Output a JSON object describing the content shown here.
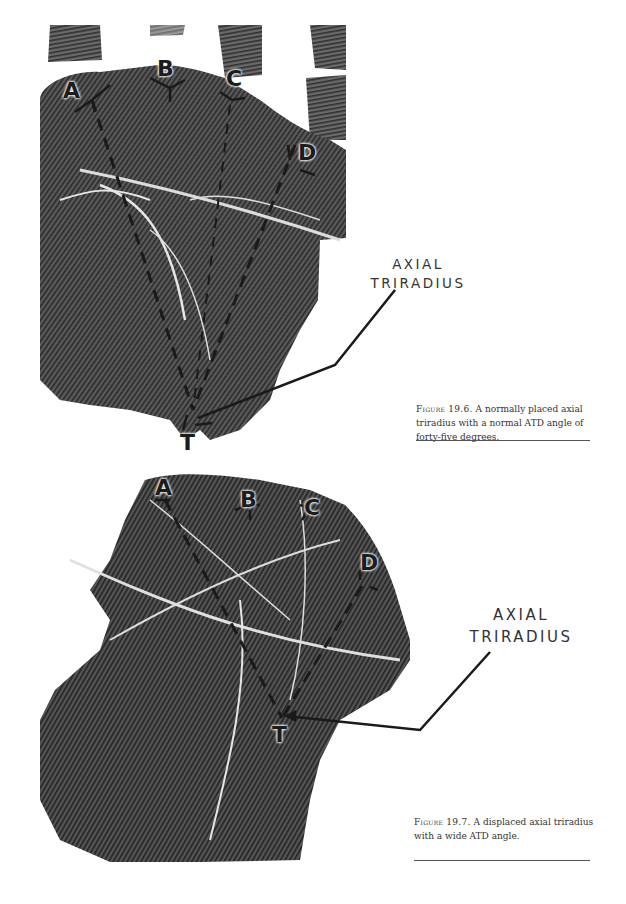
{
  "figures": [
    {
      "id": "19.6",
      "labels": {
        "a": "A",
        "b": "B",
        "c": "C",
        "d": "D",
        "t": "T"
      },
      "axial_label": {
        "line1": "AXIAL",
        "line2": "TRIRADIUS"
      },
      "caption": {
        "label": "Figure 19.6.",
        "text": " A normally placed axial triradius with a normal ATD angle of forty-five degrees."
      }
    },
    {
      "id": "19.7",
      "labels": {
        "a": "A",
        "b": "B",
        "c": "C",
        "d": "D",
        "t": "T"
      },
      "axial_label": {
        "line1": "AXIAL",
        "line2": "TRIRADIUS"
      },
      "caption": {
        "label": "Figure 19.7.",
        "text": " A displaced axial triradius with a wide ATD angle."
      }
    }
  ]
}
